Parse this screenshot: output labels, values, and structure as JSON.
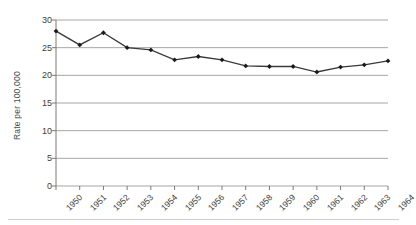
{
  "chart_data": {
    "type": "line",
    "title": "",
    "xlabel": "",
    "ylabel": "Rate per 100,000",
    "categories": [
      "1950",
      "1951",
      "1952",
      "1953",
      "1954",
      "1955",
      "1956",
      "1957",
      "1958",
      "1959",
      "1960",
      "1961",
      "1962",
      "1963",
      "1964"
    ],
    "values": [
      28.0,
      25.5,
      27.7,
      25.0,
      24.6,
      22.8,
      23.4,
      22.8,
      21.7,
      21.6,
      21.6,
      20.6,
      21.5,
      21.9,
      22.6
    ],
    "series": [
      {
        "name": "Rate per 100,000",
        "values": [
          28.0,
          25.5,
          27.7,
          25.0,
          24.6,
          22.8,
          23.4,
          22.8,
          21.7,
          21.6,
          21.6,
          20.6,
          21.5,
          21.9,
          22.6
        ]
      }
    ],
    "yticks": [
      0,
      5,
      10,
      15,
      20,
      25,
      30
    ],
    "ylim": [
      0,
      30
    ],
    "grid": "horizontal",
    "legend": "none",
    "marker": "diamond",
    "line_color": "#3a3a3a",
    "marker_color": "#1a1a1a",
    "grid_color": "#a6a6a6",
    "axis_color": "#7a7a7a",
    "background": "#ffffff"
  }
}
